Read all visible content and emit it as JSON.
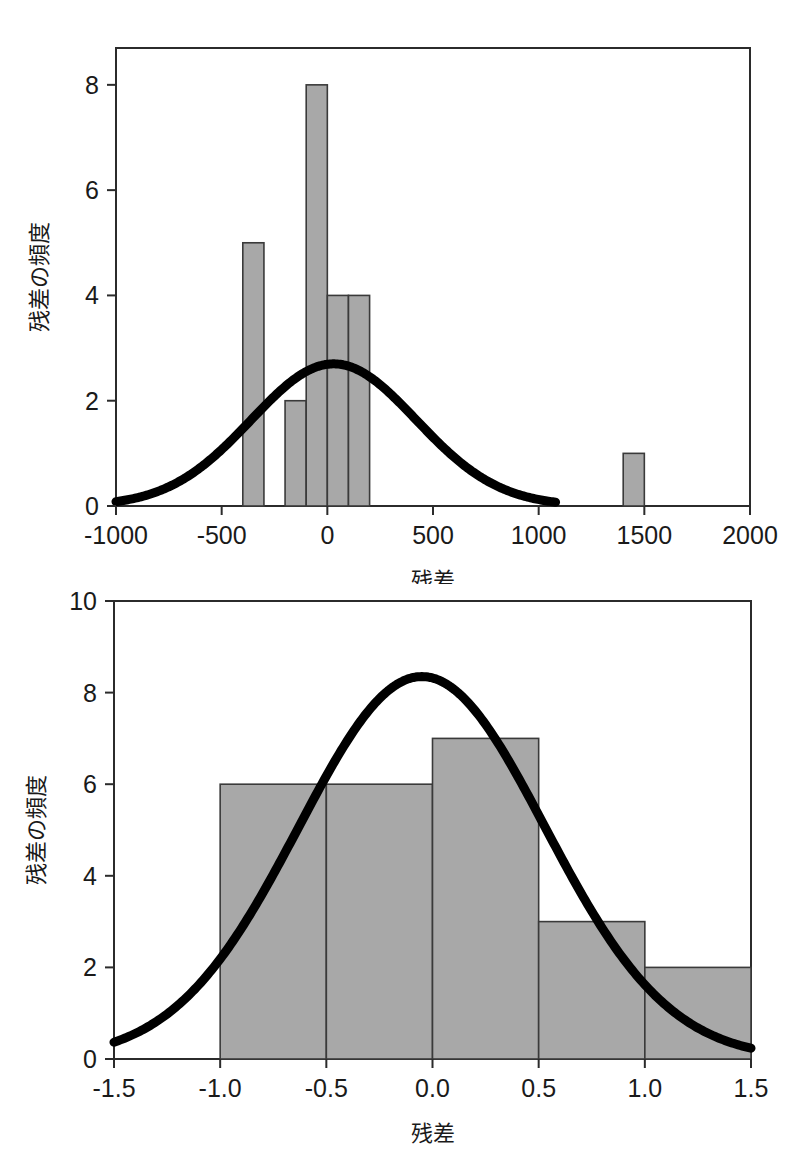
{
  "page": {
    "background_color": "#ffffff",
    "bar_fill_color": "#a8a8a8",
    "bar_stroke_color": "#3a3a3a",
    "curve_color": "#000000",
    "axis_color": "#2b2b2b"
  },
  "chart_data": [
    {
      "id": "top",
      "type": "bar",
      "title": "",
      "xlabel": "残差",
      "ylabel": "残差の頻度",
      "xlim": [
        -1000,
        2000
      ],
      "ylim": [
        0,
        8.7
      ],
      "xticks": [
        -1000,
        -500,
        0,
        500,
        1000,
        1500,
        2000
      ],
      "xtick_labels": [
        "-1000",
        "-500",
        "0",
        "500",
        "1000",
        "1500",
        "2000"
      ],
      "yticks": [
        0,
        2,
        4,
        6,
        8
      ],
      "ytick_labels": [
        "0",
        "2",
        "4",
        "6",
        "8"
      ],
      "grid": false,
      "legend": "none",
      "bin_width": 100,
      "bins": [
        {
          "left": -400,
          "right": -300,
          "value": 5
        },
        {
          "left": -200,
          "right": -100,
          "value": 2
        },
        {
          "left": -100,
          "right": 0,
          "value": 8
        },
        {
          "left": 0,
          "right": 100,
          "value": 4
        },
        {
          "left": 100,
          "right": 200,
          "value": 4
        },
        {
          "left": 1400,
          "right": 1500,
          "value": 1
        }
      ],
      "overlay_curve": {
        "name": "normal-distribution-curve",
        "type": "line",
        "mean": 30,
        "sigma": 390,
        "peak": 2.7,
        "x_start": -1000,
        "x_end": 1080
      }
    },
    {
      "id": "bottom",
      "type": "bar",
      "title": "",
      "xlabel": "残差",
      "ylabel": "残差の頻度",
      "xlim": [
        -1.5,
        1.5
      ],
      "ylim": [
        0,
        10
      ],
      "xticks": [
        -1.5,
        -1.0,
        -0.5,
        0.0,
        0.5,
        1.0,
        1.5
      ],
      "xtick_labels": [
        "-1.5",
        "-1.0",
        "-0.5",
        "0.0",
        "0.5",
        "1.0",
        "1.5"
      ],
      "yticks": [
        0,
        2,
        4,
        6,
        8,
        10
      ],
      "ytick_labels": [
        "0",
        "2",
        "4",
        "6",
        "8",
        "10"
      ],
      "grid": false,
      "legend": "none",
      "bin_width": 0.5,
      "bins": [
        {
          "left": -1.0,
          "right": -0.5,
          "value": 6
        },
        {
          "left": -0.5,
          "right": 0.0,
          "value": 6
        },
        {
          "left": 0.0,
          "right": 0.5,
          "value": 7
        },
        {
          "left": 0.5,
          "right": 1.0,
          "value": 3
        },
        {
          "left": 1.0,
          "right": 1.5,
          "value": 2
        }
      ],
      "overlay_curve": {
        "name": "normal-distribution-curve",
        "type": "line",
        "mean": -0.05,
        "sigma": 0.58,
        "peak": 8.35,
        "x_start": -1.5,
        "x_end": 1.5
      }
    }
  ]
}
